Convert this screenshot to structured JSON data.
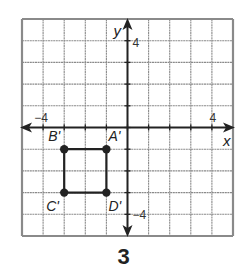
{
  "diagram": {
    "type": "coordinate-grid",
    "grid": {
      "xmin": -5,
      "xmax": 5,
      "ymin": -5,
      "ymax": 5,
      "step": 1
    },
    "axes": {
      "x_label": "x",
      "y_label": "y"
    },
    "tick_labels": {
      "x_neg": "−4",
      "x_pos": "4",
      "y_pos": "4",
      "y_neg": "−4"
    },
    "points": [
      {
        "name": "A'",
        "x": -1,
        "y": -1
      },
      {
        "name": "B'",
        "x": -3,
        "y": -1
      },
      {
        "name": "C'",
        "x": -3,
        "y": -3
      },
      {
        "name": "D'",
        "x": -1,
        "y": -3
      }
    ],
    "polygon": [
      "A'",
      "B'",
      "C'",
      "D'"
    ],
    "colors": {
      "grid": "#8a8a8a",
      "axis": "#222222",
      "shape": "#222222"
    }
  },
  "caption": "3"
}
